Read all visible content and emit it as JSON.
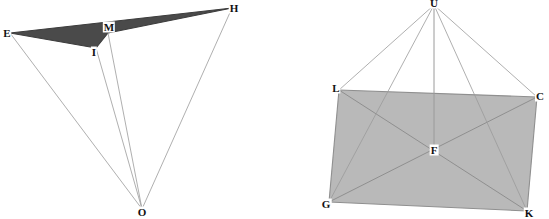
{
  "figure": {
    "title": "",
    "canvas": {
      "width": 549,
      "height": 219,
      "background": "#ffffff"
    },
    "colors": {
      "left_fill": "#4a4a4a",
      "left_stroke": "#3c3c3c",
      "right_fill": "#b9b9b9",
      "right_stroke": "#8f8f8f",
      "ray_stroke": "#9a9a9a",
      "label_text": "#111111",
      "label_background": "#ffffff"
    },
    "left_diagram": {
      "name": "thin-quadrilateral-with-apex-O",
      "points": [
        {
          "id": "E",
          "label": "E",
          "x": 10,
          "y": 33,
          "label_x": 7,
          "label_y": 33
        },
        {
          "id": "H",
          "label": "H",
          "x": 232,
          "y": 8,
          "label_x": 234,
          "label_y": 8
        },
        {
          "id": "M",
          "label": "M",
          "x": 108,
          "y": 33,
          "label_x": 109,
          "label_y": 27
        },
        {
          "id": "I",
          "label": "I",
          "x": 96,
          "y": 48,
          "label_x": 94,
          "label_y": 52
        },
        {
          "id": "O",
          "label": "O",
          "x": 142,
          "y": 209,
          "label_x": 142,
          "label_y": 212
        }
      ],
      "shaded_polygon": [
        "E",
        "H",
        "M",
        "I"
      ],
      "edges": [
        {
          "from": "E",
          "to": "H",
          "style": "dark"
        },
        {
          "from": "E",
          "to": "I",
          "style": "dark"
        },
        {
          "from": "I",
          "to": "M",
          "style": "dark"
        },
        {
          "from": "M",
          "to": "H",
          "style": "dark"
        },
        {
          "from": "E",
          "to": "O",
          "style": "ray"
        },
        {
          "from": "I",
          "to": "O",
          "style": "ray"
        },
        {
          "from": "M",
          "to": "O",
          "style": "ray"
        },
        {
          "from": "H",
          "to": "O",
          "style": "ray"
        }
      ]
    },
    "right_diagram": {
      "name": "quadrilateral-pyramid-LCKG-with-apex-U",
      "points": [
        {
          "id": "U",
          "label": "U",
          "x": 434,
          "y": 5,
          "label_x": 434,
          "label_y": 3
        },
        {
          "id": "L",
          "label": "L",
          "x": 339,
          "y": 90,
          "label_x": 336,
          "label_y": 88
        },
        {
          "id": "C",
          "label": "C",
          "x": 537,
          "y": 97,
          "label_x": 540,
          "label_y": 96
        },
        {
          "id": "G",
          "label": "G",
          "x": 329,
          "y": 202,
          "label_x": 326,
          "label_y": 204
        },
        {
          "id": "K",
          "label": "K",
          "x": 527,
          "y": 211,
          "label_x": 529,
          "label_y": 213
        },
        {
          "id": "F",
          "label": "F",
          "x": 434,
          "y": 150,
          "label_x": 434,
          "label_y": 150
        }
      ],
      "shaded_polygon": [
        "L",
        "C",
        "K",
        "G"
      ],
      "edges": [
        {
          "from": "L",
          "to": "C",
          "style": "base"
        },
        {
          "from": "C",
          "to": "K",
          "style": "base"
        },
        {
          "from": "K",
          "to": "G",
          "style": "base"
        },
        {
          "from": "G",
          "to": "L",
          "style": "base"
        },
        {
          "from": "L",
          "to": "K",
          "style": "diagonal"
        },
        {
          "from": "C",
          "to": "G",
          "style": "diagonal"
        },
        {
          "from": "U",
          "to": "L",
          "style": "ray"
        },
        {
          "from": "U",
          "to": "C",
          "style": "ray"
        },
        {
          "from": "U",
          "to": "G",
          "style": "ray"
        },
        {
          "from": "U",
          "to": "K",
          "style": "ray"
        },
        {
          "from": "U",
          "to": "F",
          "style": "altitude"
        }
      ]
    }
  }
}
